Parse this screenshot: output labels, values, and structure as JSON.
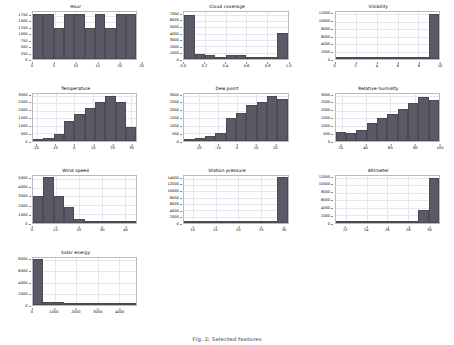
{
  "figure": {
    "caption": "Fig. 2: Selected features",
    "background": "#ffffff",
    "bar_color": "#5a5a66",
    "grid_color": "#e6e6ee",
    "axis_color": "#b9b9c4",
    "rows": 4,
    "cols": 3
  },
  "chart_data": [
    {
      "type": "bar",
      "title": "Hour",
      "xlabel": "",
      "ylabel": "",
      "xlim": [
        0,
        24
      ],
      "ylim": [
        0,
        1900
      ],
      "xticks": [
        "0",
        "5",
        "10",
        "15",
        "20",
        "25"
      ],
      "xtick_values": [
        0,
        5,
        10,
        15,
        20,
        25
      ],
      "yticks": [
        "0",
        "250",
        "500",
        "750",
        "1000",
        "1250",
        "1500",
        "1750"
      ],
      "ytick_values": [
        0,
        250,
        500,
        750,
        1000,
        1250,
        1500,
        1750
      ],
      "grid": true,
      "bin_edges": [
        0,
        2.4,
        4.8,
        7.2,
        9.6,
        12,
        14.4,
        16.8,
        19.2,
        21.6,
        24
      ],
      "values": [
        1800,
        1800,
        1250,
        1800,
        1800,
        1250,
        1800,
        1250,
        1800,
        1800
      ]
    },
    {
      "type": "bar",
      "title": "Cloud coverage",
      "xlabel": "",
      "ylabel": "",
      "xlim": [
        0.0,
        1.0
      ],
      "ylim": [
        0,
        7400
      ],
      "xticks": [
        "0.0",
        "0.2",
        "0.4",
        "0.6",
        "0.8",
        "1.0"
      ],
      "xtick_values": [
        0.0,
        0.2,
        0.4,
        0.6,
        0.8,
        1.0
      ],
      "yticks": [
        "0",
        "1000",
        "2000",
        "3000",
        "4000",
        "5000",
        "6000",
        "7000"
      ],
      "ytick_values": [
        0,
        1000,
        2000,
        3000,
        4000,
        5000,
        6000,
        7000
      ],
      "grid": true,
      "bin_edges": [
        0.0,
        0.1,
        0.2,
        0.3,
        0.4,
        0.5,
        0.6,
        0.7,
        0.8,
        0.9,
        1.0
      ],
      "values": [
        7000,
        850,
        700,
        250,
        600,
        600,
        250,
        250,
        250,
        4100
      ]
    },
    {
      "type": "bar",
      "title": "Visibility",
      "xlabel": "",
      "ylabel": "",
      "xlim": [
        0,
        10
      ],
      "ylim": [
        0,
        12600
      ],
      "xticks": [
        "0",
        "2",
        "4",
        "6",
        "8",
        "10"
      ],
      "xtick_values": [
        0,
        2,
        4,
        6,
        8,
        10
      ],
      "yticks": [
        "0",
        "2000",
        "4000",
        "6000",
        "8000",
        "10000",
        "12000"
      ],
      "ytick_values": [
        0,
        2000,
        4000,
        6000,
        8000,
        10000,
        12000
      ],
      "grid": true,
      "bin_edges": [
        0,
        1,
        2,
        3,
        4,
        5,
        6,
        7,
        8,
        9,
        10
      ],
      "values": [
        60,
        40,
        40,
        60,
        80,
        120,
        180,
        260,
        500,
        12000
      ]
    },
    {
      "type": "bar",
      "title": "Temperature",
      "xlabel": "",
      "ylabel": "",
      "xlim": [
        -22,
        33
      ],
      "ylim": [
        0,
        3100
      ],
      "xticks": [
        "-20",
        "-10",
        "0",
        "10",
        "20",
        "30"
      ],
      "xtick_values": [
        -20,
        -10,
        0,
        10,
        20,
        30
      ],
      "yticks": [
        "0",
        "500",
        "1000",
        "1500",
        "2000",
        "2500",
        "3000"
      ],
      "ytick_values": [
        0,
        500,
        1000,
        1500,
        2000,
        2500,
        3000
      ],
      "grid": true,
      "bin_edges": [
        -22,
        -16.5,
        -11,
        -5.5,
        0,
        5.5,
        11,
        16.5,
        22,
        27.5,
        33
      ],
      "values": [
        60,
        180,
        430,
        1300,
        1800,
        2150,
        2600,
        3000,
        2550,
        900
      ]
    },
    {
      "type": "bar",
      "title": "Dew point",
      "xlabel": "",
      "ylabel": "",
      "xlim": [
        -28,
        27
      ],
      "ylim": [
        0,
        3100
      ],
      "xticks": [
        "-20",
        "-10",
        "0",
        "10",
        "20"
      ],
      "xtick_values": [
        -20,
        -10,
        0,
        10,
        20
      ],
      "yticks": [
        "0",
        "500",
        "1000",
        "1500",
        "2000",
        "2500",
        "3000"
      ],
      "ytick_values": [
        0,
        500,
        1000,
        1500,
        2000,
        2500,
        3000
      ],
      "grid": true,
      "bin_edges": [
        -28,
        -22.5,
        -17,
        -11.5,
        -6,
        -0.5,
        5,
        10.5,
        16,
        21.5,
        27
      ],
      "values": [
        80,
        200,
        330,
        500,
        1500,
        1850,
        2350,
        2600,
        3000,
        2800,
        1200
      ]
    },
    {
      "type": "bar",
      "title": "Relative humidity",
      "xlabel": "",
      "ylabel": "",
      "xlim": [
        15,
        100
      ],
      "ylim": [
        0,
        3100
      ],
      "xticks": [
        "20",
        "40",
        "60",
        "80",
        "100"
      ],
      "xtick_values": [
        20,
        40,
        60,
        80,
        100
      ],
      "yticks": [
        "0",
        "500",
        "1000",
        "1500",
        "2000",
        "2500",
        "3000"
      ],
      "ytick_values": [
        0,
        500,
        1000,
        1500,
        2000,
        2500,
        3000
      ],
      "grid": true,
      "bin_edges": [
        15,
        23.5,
        32,
        40.5,
        49,
        57.5,
        66,
        74.5,
        83,
        91.5,
        100
      ],
      "values": [
        600,
        520,
        700,
        1200,
        1550,
        1800,
        2100,
        2500,
        2900,
        2700
      ]
    },
    {
      "type": "bar",
      "title": "Wind speed",
      "xlabel": "",
      "ylabel": "",
      "xlim": [
        0,
        45
      ],
      "ylim": [
        0,
        5300
      ],
      "xticks": [
        "0",
        "10",
        "20",
        "30",
        "40"
      ],
      "xtick_values": [
        0,
        10,
        20,
        30,
        40
      ],
      "yticks": [
        "0",
        "1000",
        "2000",
        "3000",
        "4000",
        "5000"
      ],
      "ytick_values": [
        0,
        1000,
        2000,
        3000,
        4000,
        5000
      ],
      "grid": true,
      "bin_edges": [
        0,
        4.5,
        9,
        13.5,
        18,
        22.5,
        27,
        31.5,
        36,
        40.5,
        45
      ],
      "values": [
        3050,
        5150,
        3100,
        1750,
        400,
        150,
        60,
        30,
        15,
        10
      ]
    },
    {
      "type": "bar",
      "title": "Station pressure",
      "xlabel": "",
      "ylabel": "",
      "xlim": [
        8,
        31
      ],
      "ylim": [
        0,
        14800
      ],
      "xticks": [
        "10",
        "15",
        "20",
        "25",
        "30"
      ],
      "xtick_values": [
        10,
        15,
        20,
        25,
        30
      ],
      "yticks": [
        "0",
        "2000",
        "4000",
        "6000",
        "8000",
        "10000",
        "12000",
        "14000"
      ],
      "ytick_values": [
        0,
        2000,
        4000,
        6000,
        8000,
        10000,
        12000,
        14000
      ],
      "grid": true,
      "bin_edges": [
        8,
        10.3,
        12.6,
        14.9,
        17.2,
        19.5,
        21.8,
        24.1,
        26.4,
        28.7,
        31
      ],
      "values": [
        160,
        40,
        30,
        30,
        30,
        30,
        30,
        40,
        60,
        14500
      ]
    },
    {
      "type": "bar",
      "title": "Altimeter",
      "xlabel": "",
      "ylabel": "",
      "xlim": [
        21,
        31
      ],
      "ylim": [
        0,
        12400
      ],
      "xticks": [
        "22",
        "24",
        "26",
        "28",
        "30"
      ],
      "xtick_values": [
        22,
        24,
        26,
        28,
        30
      ],
      "yticks": [
        "0",
        "2000",
        "4000",
        "6000",
        "8000",
        "10000",
        "12000"
      ],
      "ytick_values": [
        0,
        2000,
        4000,
        6000,
        8000,
        10000,
        12000
      ],
      "grid": true,
      "bin_edges": [
        21,
        22,
        23,
        24,
        25,
        26,
        27,
        28,
        29,
        30,
        31
      ],
      "values": [
        30,
        20,
        20,
        20,
        20,
        20,
        30,
        40,
        3500,
        12000
      ]
    },
    {
      "type": "bar",
      "title": "Solar energy",
      "xlabel": "",
      "ylabel": "",
      "xlim": [
        0,
        4800
      ],
      "ylim": [
        0,
        8400
      ],
      "xticks": [
        "0",
        "1000",
        "2000",
        "3000",
        "4000"
      ],
      "xtick_values": [
        0,
        1000,
        2000,
        3000,
        4000
      ],
      "yticks": [
        "0",
        "2000",
        "4000",
        "6000",
        "8000"
      ],
      "ytick_values": [
        0,
        2000,
        4000,
        6000,
        8000
      ],
      "grid": true,
      "bin_edges": [
        0,
        480,
        960,
        1440,
        1920,
        2400,
        2880,
        3360,
        3840,
        4320,
        4800
      ],
      "values": [
        8200,
        600,
        450,
        300,
        230,
        180,
        150,
        120,
        100,
        80
      ]
    }
  ]
}
